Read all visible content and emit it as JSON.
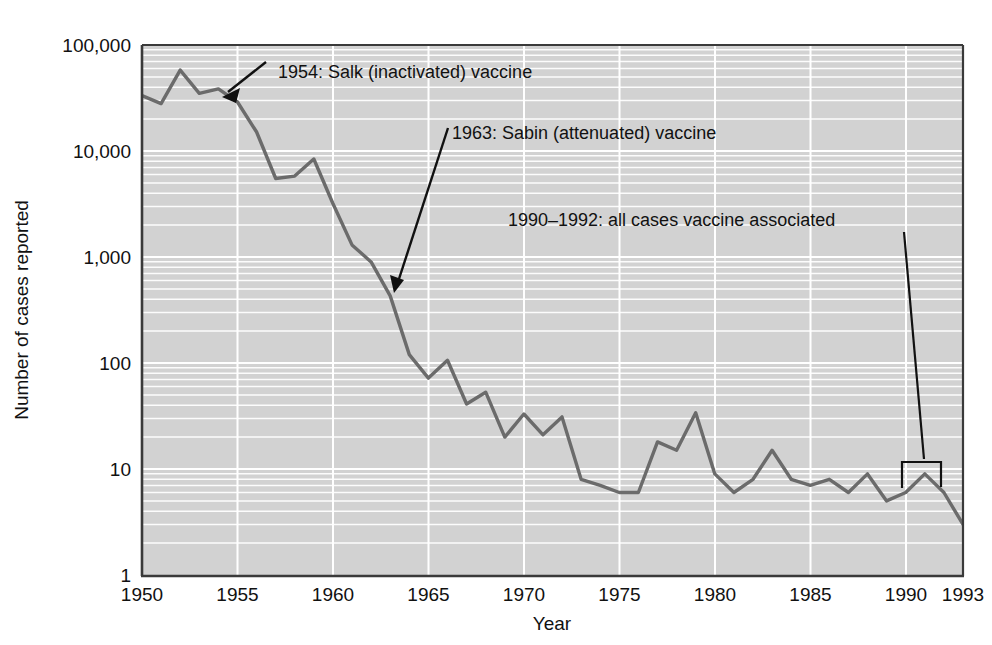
{
  "chart_data": {
    "type": "line",
    "title": "",
    "xlabel": "Year",
    "ylabel": "Number of cases reported",
    "xlim": [
      1950,
      1993
    ],
    "ylim": [
      1,
      100000
    ],
    "yscale": "log",
    "grid": true,
    "legend": "none",
    "xticks": [
      "1950",
      "1955",
      "1960",
      "1965",
      "1970",
      "1975",
      "1980",
      "1985",
      "1990",
      "1993"
    ],
    "xtick_values": [
      1950,
      1955,
      1960,
      1965,
      1970,
      1975,
      1980,
      1985,
      1990,
      1993
    ],
    "yticks": [
      "1",
      "10",
      "100",
      "1,000",
      "10,000",
      "100,000"
    ],
    "ytick_values": [
      1,
      10,
      100,
      1000,
      10000,
      100000
    ],
    "x": [
      1950,
      1951,
      1952,
      1953,
      1954,
      1955,
      1956,
      1957,
      1958,
      1959,
      1960,
      1961,
      1962,
      1963,
      1964,
      1965,
      1966,
      1967,
      1968,
      1969,
      1970,
      1971,
      1972,
      1973,
      1974,
      1975,
      1976,
      1977,
      1978,
      1979,
      1980,
      1981,
      1982,
      1983,
      1984,
      1985,
      1986,
      1987,
      1988,
      1989,
      1990,
      1991,
      1992,
      1993
    ],
    "values": [
      33300,
      28000,
      58000,
      35000,
      38500,
      29000,
      15100,
      5500,
      5800,
      8400,
      3200,
      1300,
      900,
      430,
      120,
      72,
      106,
      41,
      53,
      20,
      33,
      21,
      31,
      8,
      7,
      6,
      6,
      18,
      15,
      34,
      9,
      6,
      8,
      15,
      8,
      7,
      8,
      6,
      9,
      5,
      6,
      9,
      6,
      3
    ],
    "series_name": "Paralytic poliomyelitis cases",
    "annotations": [
      {
        "label": "1954: Salk (inactivated) vaccine",
        "year": 1954,
        "kind": "arrow"
      },
      {
        "label": "1963: Sabin (attenuated) vaccine",
        "year": 1963,
        "kind": "arrow"
      },
      {
        "label": "1990–1992: all cases vaccine associated",
        "year": 1991,
        "kind": "bracket"
      }
    ]
  }
}
